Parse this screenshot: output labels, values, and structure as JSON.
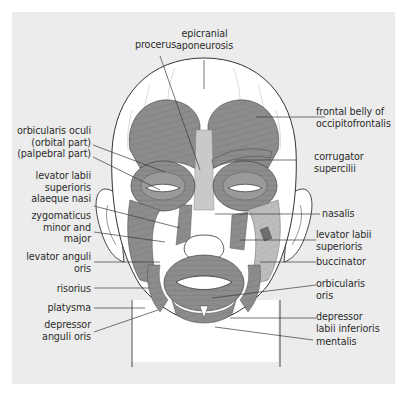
{
  "figure": {
    "colors": {
      "panel_background": "#ececec",
      "muscle_fill": "#8c8c8c",
      "muscle_light": "#bdbdbd",
      "skin": "#ffffff",
      "outline": "#333333",
      "leader_line": "#3a3a3a",
      "label_text": "#2b2b2b"
    }
  },
  "labels": {
    "top": [
      {
        "id": "procerus",
        "lines": [
          "procerus"
        ]
      },
      {
        "id": "epicranial-aponeurosis",
        "lines": [
          "epicranial",
          "aponeurosis"
        ]
      }
    ],
    "left": [
      {
        "id": "orbicularis-oculi",
        "lines": [
          "orbicularis oculi",
          "(orbital part)",
          "(palpebral part)"
        ]
      },
      {
        "id": "levator-labii-superioris-alaeque-nasi",
        "lines": [
          "levator labii",
          "superioris",
          "alaeque nasi"
        ]
      },
      {
        "id": "zygomaticus-minor-and-major",
        "lines": [
          "zygomaticus",
          "minor and",
          "major"
        ]
      },
      {
        "id": "levator-anguli-oris",
        "lines": [
          "levator anguli",
          "oris"
        ]
      },
      {
        "id": "risorius",
        "lines": [
          "risorius"
        ]
      },
      {
        "id": "platysma",
        "lines": [
          "platysma"
        ]
      },
      {
        "id": "depressor-anguli-oris",
        "lines": [
          "depressor",
          "anguli oris"
        ]
      }
    ],
    "right": [
      {
        "id": "frontal-belly-of-occipitofrontalis",
        "lines": [
          "frontal belly of",
          "occipitofrontalis"
        ]
      },
      {
        "id": "corrugator-supercilii",
        "lines": [
          "corrugator",
          "supercilii"
        ]
      },
      {
        "id": "nasalis",
        "lines": [
          "nasalis"
        ]
      },
      {
        "id": "levator-labii-superioris",
        "lines": [
          "levator labii",
          "superioris"
        ]
      },
      {
        "id": "buccinator",
        "lines": [
          "buccinator"
        ]
      },
      {
        "id": "orbicularis-oris",
        "lines": [
          "orbicularis",
          "oris"
        ]
      },
      {
        "id": "depressor-labii-inferioris",
        "lines": [
          "depressor",
          "labii inferioris"
        ]
      },
      {
        "id": "mentalis",
        "lines": [
          "mentalis"
        ]
      }
    ]
  }
}
